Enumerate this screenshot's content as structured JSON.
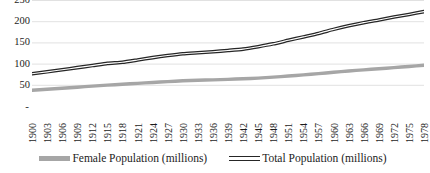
{
  "chart_data": {
    "type": "line",
    "title": "",
    "xlabel": "",
    "ylabel": "",
    "ylim": [
      0,
      250
    ],
    "yticks": [
      "-",
      "50",
      "100",
      "150",
      "200",
      "250"
    ],
    "ytick_values": [
      0,
      50,
      100,
      150,
      200,
      250
    ],
    "grid": true,
    "legend_position": "bottom",
    "categories": [
      "1900",
      "1903",
      "1906",
      "1909",
      "1912",
      "1915",
      "1918",
      "1921",
      "1924",
      "1927",
      "1930",
      "1933",
      "1936",
      "1939",
      "1942",
      "1945",
      "1948",
      "1951",
      "1954",
      "1957",
      "1960",
      "1963",
      "1966",
      "1969",
      "1972",
      "1975",
      "1978"
    ],
    "series": [
      {
        "name": "Female Population (millions)",
        "color": "#a6a6a6",
        "values": [
          37.2,
          39.5,
          41.8,
          44.3,
          46.9,
          49.2,
          51.3,
          53.4,
          55.6,
          57.6,
          59.4,
          60.6,
          61.7,
          62.9,
          64.3,
          65.8,
          68.0,
          70.6,
          73.3,
          76.3,
          79.6,
          82.6,
          85.3,
          87.9,
          90.5,
          93.2,
          96.1
        ]
      },
      {
        "name": "Total Population (millions)",
        "color": "#262626",
        "values": [
          76.1,
          80.6,
          85.4,
          90.5,
          95.3,
          100.5,
          103.2,
          108.5,
          114.1,
          119.0,
          123.2,
          125.6,
          128.1,
          130.9,
          134.2,
          139.9,
          146.6,
          154.9,
          163.0,
          171.2,
          180.7,
          189.2,
          196.6,
          202.7,
          209.9,
          216.0,
          222.6
        ]
      }
    ]
  },
  "legend": {
    "items": [
      {
        "label": "Female Population (millions)",
        "swatch": "series-female"
      },
      {
        "label": "Total Population (millions)",
        "swatch": "series-total"
      }
    ]
  }
}
